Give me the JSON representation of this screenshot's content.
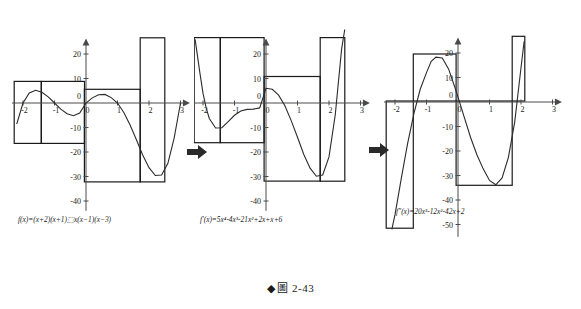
{
  "figure": {
    "caption_marker": "◆",
    "caption_label": "圖",
    "caption_number": "2-43"
  },
  "arrows": [
    {
      "name": "arrow-1",
      "glyph": "➡",
      "x": 186,
      "y": 143
    },
    {
      "name": "arrow-2",
      "glyph": "➡",
      "x": 368,
      "y": 141
    }
  ],
  "panels": [
    {
      "id": "panel-f",
      "formula": "f(x)=(x+2)(x+1)⬚x(x−1)(x−3)",
      "x_ticks": [
        {
          "value": -2,
          "label": "-2"
        },
        {
          "value": -1,
          "label": "-1"
        },
        {
          "value": 0,
          "label": "0"
        },
        {
          "value": 1,
          "label": "1"
        },
        {
          "value": 2,
          "label": "2"
        },
        {
          "value": 3,
          "label": "3"
        }
      ],
      "y_ticks": [
        {
          "value": 20,
          "label": "20"
        },
        {
          "value": 10,
          "label": "10"
        },
        {
          "value": 0,
          "label": "0"
        },
        {
          "value": -10,
          "label": "-10"
        },
        {
          "value": -20,
          "label": "-20"
        },
        {
          "value": -30,
          "label": "-30"
        },
        {
          "value": -40,
          "label": "-40"
        }
      ],
      "origin_label": "0"
    },
    {
      "id": "panel-fprime",
      "formula": "f′(x)=5x⁴-4x³-21x²+2x+x+6",
      "x_ticks": [
        {
          "value": -2,
          "label": "-2"
        },
        {
          "value": -1,
          "label": "-1"
        },
        {
          "value": 0,
          "label": "0"
        },
        {
          "value": 1,
          "label": "1"
        },
        {
          "value": 2,
          "label": "2"
        },
        {
          "value": 3,
          "label": "3"
        }
      ],
      "y_ticks": [
        {
          "value": 20,
          "label": "20"
        },
        {
          "value": 10,
          "label": "10"
        },
        {
          "value": 0,
          "label": "0"
        },
        {
          "value": -10,
          "label": "-10"
        },
        {
          "value": -20,
          "label": "-20"
        },
        {
          "value": -30,
          "label": "-30"
        },
        {
          "value": -40,
          "label": "-40"
        }
      ],
      "origin_label": "0"
    },
    {
      "id": "panel-fdoubleprime",
      "formula": "f″(x)=20x³-12x²-42x+2",
      "x_ticks": [
        {
          "value": -2,
          "label": "-2"
        },
        {
          "value": -1,
          "label": "-1"
        },
        {
          "value": 0,
          "label": "0"
        },
        {
          "value": 1,
          "label": "1"
        },
        {
          "value": 2,
          "label": "2"
        },
        {
          "value": 3,
          "label": "3"
        }
      ],
      "y_ticks": [
        {
          "value": 20,
          "label": "20"
        },
        {
          "value": 10,
          "label": "10"
        },
        {
          "value": 0,
          "label": "0"
        },
        {
          "value": -10,
          "label": "-10"
        },
        {
          "value": -20,
          "label": "-20"
        },
        {
          "value": -30,
          "label": "-30"
        },
        {
          "value": -40,
          "label": "-40"
        },
        {
          "value": -50,
          "label": "-50"
        }
      ],
      "origin_label": "0"
    }
  ],
  "chart_data": [
    {
      "type": "line",
      "title": "f(x)=(x+2)(x+1)x(x-1)(x-3)",
      "xlabel": "x",
      "ylabel": "y",
      "xlim": [
        -2.35,
        3.3
      ],
      "ylim": [
        -44,
        28
      ],
      "grid": false,
      "legend": "none",
      "expression": "(x+2)*(x+1)*x*(x-1)*(x-3)",
      "x": [
        -2.2,
        -2.0,
        -1.8,
        -1.6,
        -1.4,
        -1.2,
        -1.0,
        -0.8,
        -0.6,
        -0.4,
        -0.2,
        0.0,
        0.2,
        0.4,
        0.6,
        0.8,
        1.0,
        1.2,
        1.4,
        1.6,
        1.8,
        2.0,
        2.2,
        2.4,
        2.6,
        2.8,
        3.0
      ],
      "y": [
        -8.6,
        0.0,
        4.1,
        5.2,
        4.4,
        2.5,
        0.0,
        -2.5,
        -4.4,
        -5.2,
        -4.1,
        0.0,
        2.1,
        3.4,
        3.5,
        2.2,
        0.0,
        -3.9,
        -9.0,
        -15.0,
        -21.2,
        -26.4,
        -29.6,
        -29.4,
        -24.6,
        -14.2,
        0.0
      ],
      "boxes": [
        {
          "name": "rect-left-outer",
          "x0": -2.28,
          "x1": -1.42,
          "y0": -16.5,
          "y1": 8.8
        },
        {
          "name": "rect-left-inner",
          "x0": -1.42,
          "x1": -0.05,
          "y0": -16.5,
          "y1": 8.8
        },
        {
          "name": "rect-mid",
          "x0": -0.05,
          "x1": 1.72,
          "y0": -32.2,
          "y1": 5.6
        },
        {
          "name": "rect-right",
          "x0": 1.72,
          "x1": 2.5,
          "y0": -32.2,
          "y1": 26.6
        }
      ]
    },
    {
      "type": "line",
      "title": "f'(x)=5x^4-4x^3-21x^2+2x+x+6",
      "xlabel": "x",
      "ylabel": "y",
      "xlim": [
        -2.35,
        3.3
      ],
      "ylim": [
        -44,
        28
      ],
      "grid": false,
      "legend": "none",
      "expression": "5*x^4-4*x^3-21*x^2+3*x+6",
      "x": [
        -2.25,
        -2.1,
        -2.0,
        -1.9,
        -1.8,
        -1.6,
        -1.4,
        -1.2,
        -1.0,
        -0.8,
        -0.6,
        -0.4,
        -0.2,
        0.0,
        0.2,
        0.4,
        0.6,
        0.8,
        1.0,
        1.2,
        1.4,
        1.6,
        1.8,
        2.0,
        2.2,
        2.4,
        2.5
      ],
      "y": [
        26.0,
        12.4,
        4.0,
        -2.0,
        -6.3,
        -10.2,
        -10.1,
        -7.6,
        -5.0,
        -3.3,
        -2.6,
        -2.5,
        -2.0,
        6.0,
        5.6,
        3.2,
        -1.1,
        -7.2,
        -14.0,
        -21.0,
        -26.6,
        -29.9,
        -29.4,
        -22.0,
        -4.7,
        22.0,
        30.0
      ],
      "boxes": [
        {
          "name": "rect-left-outer",
          "x0": -2.28,
          "x1": -1.45,
          "y0": -16.2,
          "y1": 26.7
        },
        {
          "name": "rect-left-inner",
          "x0": -1.45,
          "x1": -0.06,
          "y0": -16.2,
          "y1": 26.7
        },
        {
          "name": "rect-mid",
          "x0": -0.06,
          "x1": 1.72,
          "y0": -31.9,
          "y1": 10.8
        },
        {
          "name": "rect-right",
          "x0": 1.72,
          "x1": 2.5,
          "y0": -31.9,
          "y1": 26.7
        }
      ]
    },
    {
      "type": "line",
      "title": "f''(x)=20x^3-12x^2-42x+2",
      "xlabel": "x",
      "ylabel": "y",
      "xlim": [
        -2.35,
        3.3
      ],
      "ylim": [
        -55,
        28
      ],
      "grid": false,
      "legend": "none",
      "expression": "20*x^3-12*x^2-42*x+2",
      "x": [
        -2.1,
        -2.0,
        -1.9,
        -1.8,
        -1.7,
        -1.6,
        -1.4,
        -1.2,
        -1.0,
        -0.85,
        -0.7,
        -0.5,
        -0.3,
        -0.1,
        0.0,
        0.2,
        0.4,
        0.6,
        0.8,
        1.0,
        1.2,
        1.4,
        1.6,
        1.8,
        2.0,
        2.1
      ],
      "y": [
        -52.0,
        -46.0,
        -38.6,
        -31.2,
        -24.0,
        -17.0,
        -4.7,
        5.2,
        12.0,
        16.6,
        18.3,
        18.0,
        13.5,
        6.0,
        2.0,
        -6.3,
        -14.5,
        -21.5,
        -27.3,
        -32.0,
        -33.8,
        -31.0,
        -22.6,
        -8.2,
        14.0,
        24.8
      ],
      "boxes": [
        {
          "name": "rect-left",
          "x0": -2.28,
          "x1": -1.42,
          "y0": -51.5,
          "y1": 0.4
        },
        {
          "name": "rect-mid-left",
          "x0": -1.42,
          "x1": -0.06,
          "y0": 0.4,
          "y1": 19.6
        },
        {
          "name": "rect-mid",
          "x0": -0.06,
          "x1": 1.72,
          "y0": -34.0,
          "y1": 0.4
        },
        {
          "name": "rect-right",
          "x0": 1.72,
          "x1": 2.12,
          "y0": 0.4,
          "y1": 26.8
        }
      ]
    }
  ]
}
